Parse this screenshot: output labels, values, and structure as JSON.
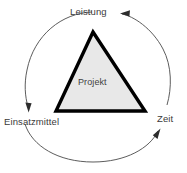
{
  "diagram": {
    "center_label": "Projekt",
    "corners": [
      {
        "id": "leistung",
        "label": "Leistung",
        "position": "top"
      },
      {
        "id": "einsatzmittel",
        "label": "Einsatzmittel",
        "position": "bottom-left"
      },
      {
        "id": "zeit",
        "label": "Zeit",
        "position": "bottom-right"
      }
    ],
    "arrows": [
      {
        "id": "arrow-to-leistung",
        "target": "Leistung",
        "direction": "left"
      },
      {
        "id": "arrow-to-einsatzmittel",
        "target": "Einsatzmittel",
        "direction": "down"
      },
      {
        "id": "arrow-to-zeit",
        "target": "Zeit",
        "direction": "up-right"
      }
    ],
    "colors": {
      "background": "#ffffff",
      "triangle_fill": "#e8e8e8",
      "triangle_stroke": "#000000",
      "arc_stroke": "#4a4a4a",
      "text": "#3a3a3a"
    }
  }
}
